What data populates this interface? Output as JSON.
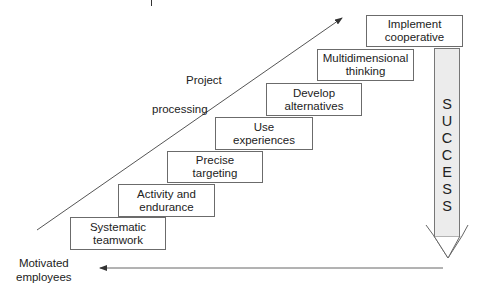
{
  "diagram": {
    "steps": [
      {
        "line1": "Systematic",
        "line2": "teamwork"
      },
      {
        "line1": "Activity and",
        "line2": "endurance"
      },
      {
        "line1": "Precise",
        "line2": "targeting"
      },
      {
        "line1": "Use",
        "line2": "experiences"
      },
      {
        "line1": "Develop",
        "line2": "alternatives"
      },
      {
        "line1": "Multidimensional",
        "line2": "thinking"
      },
      {
        "line1": "Implement",
        "line2": "cooperative"
      }
    ],
    "diagonal_label": {
      "line1": "Project",
      "line2": "processing"
    },
    "bottom_label": {
      "line1": "Motivated",
      "line2": "employees"
    },
    "success_letters": [
      "S",
      "U",
      "C",
      "C",
      "E",
      "S",
      "S"
    ],
    "colors": {
      "border": "#6b6b6b",
      "success_fill": "#ececec",
      "line": "#555555"
    }
  }
}
